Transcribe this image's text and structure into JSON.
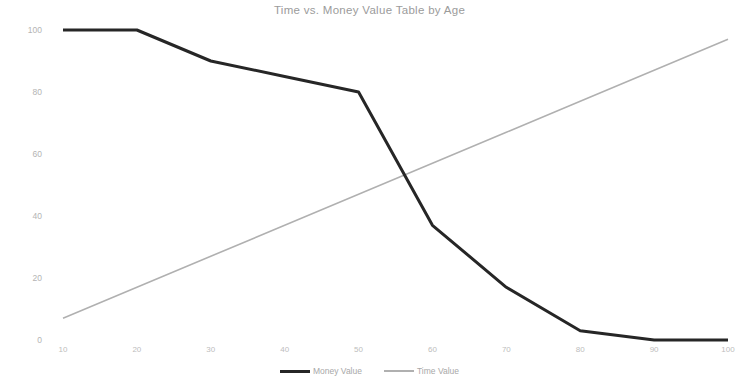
{
  "chart_data": {
    "type": "line",
    "title": "Time vs. Money Value Table by Age",
    "xlabel": "",
    "ylabel": "",
    "xlim": [
      10,
      100
    ],
    "ylim": [
      0,
      100
    ],
    "grid": false,
    "legend_position": "bottom-center",
    "x": [
      10,
      20,
      30,
      40,
      50,
      60,
      70,
      80,
      90,
      100
    ],
    "xticks": [
      "10",
      "20",
      "30",
      "40",
      "50",
      "60",
      "70",
      "80",
      "90",
      "100"
    ],
    "yticks": [
      "0",
      "20",
      "40",
      "60",
      "80",
      "100"
    ],
    "ytick_values": [
      0,
      20,
      40,
      60,
      80,
      100
    ],
    "series": [
      {
        "name": "Money Value",
        "color": "#262626",
        "width": 3,
        "values": [
          100,
          100,
          90,
          85,
          80,
          37,
          17,
          3,
          0,
          0
        ]
      },
      {
        "name": "Time Value",
        "color": "#b0b0b0",
        "width": 1.5,
        "values": [
          7,
          17,
          27,
          37,
          47,
          57,
          67,
          77,
          87,
          97
        ]
      }
    ]
  },
  "legend": {
    "items": [
      {
        "label": "Money Value"
      },
      {
        "label": "Time Value"
      }
    ]
  },
  "colors": {
    "background": "#ffffff",
    "title": "#9b9b9b",
    "tick": "#b8b8b8",
    "money_value": "#262626",
    "time_value": "#b0b0b0"
  }
}
